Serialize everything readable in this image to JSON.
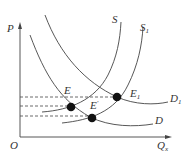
{
  "diagram": {
    "type": "supply-demand",
    "axes": {
      "y_label": "P",
      "x_label": "Q",
      "x_label_sub": "x",
      "origin": "O"
    },
    "curves": [
      {
        "id": "S",
        "label": "S",
        "label_sub": ""
      },
      {
        "id": "S1",
        "label": "S",
        "label_sub": "1"
      },
      {
        "id": "D",
        "label": "D",
        "label_sub": ""
      },
      {
        "id": "D1",
        "label": "D",
        "label_sub": "1"
      }
    ],
    "points": [
      {
        "id": "E",
        "label": "E",
        "label_sup": ""
      },
      {
        "id": "E_prime",
        "label": "E",
        "label_sup": "'"
      },
      {
        "id": "E1",
        "label": "E",
        "label_sub": "1"
      }
    ],
    "colors": {
      "line": "#444444",
      "point": "#111111",
      "background": "#ffffff"
    }
  }
}
